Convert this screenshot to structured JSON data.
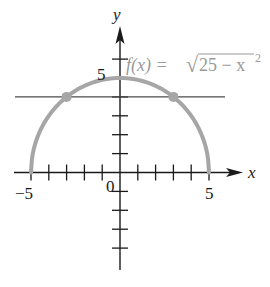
{
  "diagram": {
    "function_label": {
      "prefix": "f(x) = ",
      "radical": "√",
      "radicand": "25 − x",
      "exponent": "2"
    },
    "axes": {
      "x_label": "x",
      "y_label": "y",
      "origin_label": "0",
      "x_tick_labels": [
        {
          "value": -5,
          "text": "−5"
        },
        {
          "value": 5,
          "text": "5"
        }
      ],
      "y_tick_labels": [
        {
          "value": 5,
          "text": "5"
        }
      ],
      "x_range": [
        -5,
        5
      ],
      "y_ticks_above": [
        1,
        2,
        3,
        4,
        5,
        6
      ],
      "y_ticks_below": [
        -1,
        -2,
        -3,
        -4
      ],
      "x_ticks": [
        -5,
        -4,
        -3,
        -2,
        -1,
        1,
        2,
        3,
        4,
        5
      ]
    },
    "curve": {
      "equation": "f(x) = sqrt(25 - x^2)",
      "domain": [
        -5,
        5
      ],
      "color": "#a6a6a6"
    },
    "horizontal_line": {
      "y": 4,
      "x_extent": [
        -5.9,
        5.9
      ],
      "color": "#4a4a4a"
    },
    "intersection_points": [
      {
        "x": -3,
        "y": 4
      },
      {
        "x": 3,
        "y": 4
      }
    ]
  }
}
